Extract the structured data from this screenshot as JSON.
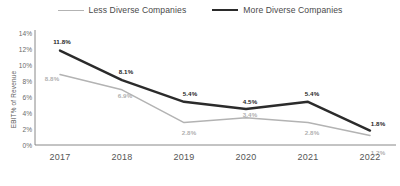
{
  "legend": {
    "entries": [
      {
        "label": "Less Diverse Companies",
        "color": "#b3b3b3",
        "key": "less"
      },
      {
        "label": "More Diverse Companies",
        "color": "#2b2b2b",
        "key": "more"
      }
    ]
  },
  "axes": {
    "ylabel": "EBIT% of Revenue",
    "yticks": [
      "14%",
      "12%",
      "10%",
      "8%",
      "6%",
      "4%",
      "2%",
      "0%"
    ],
    "xticks": [
      "2017",
      "2018",
      "2019",
      "2020",
      "2021",
      "2022"
    ]
  },
  "labels": {
    "less": [
      "8.8%",
      "6.9%",
      "2.8%",
      "3.4%",
      "2.8%",
      "1.2%"
    ],
    "more": [
      "11.8%",
      "8.1%",
      "5.4%",
      "4.5%",
      "5.4%",
      "1.8%"
    ]
  },
  "chart_data": {
    "type": "line",
    "title": "",
    "subtitle": "",
    "xlabel": "",
    "ylabel": "EBIT% of Revenue",
    "categories": [
      "2017",
      "2018",
      "2019",
      "2020",
      "2021",
      "2022"
    ],
    "series": [
      {
        "name": "Less Diverse Companies",
        "color": "#b3b3b3",
        "values": [
          8.8,
          6.9,
          2.8,
          3.4,
          2.8,
          1.2
        ]
      },
      {
        "name": "More Diverse Companies",
        "color": "#2b2b2b",
        "values": [
          11.8,
          8.1,
          5.4,
          4.5,
          5.4,
          1.8
        ]
      }
    ],
    "ylim": [
      0,
      14
    ],
    "ytick_values": [
      0,
      2,
      4,
      6,
      8,
      10,
      12,
      14
    ],
    "ytick_labels": [
      "0%",
      "2%",
      "4%",
      "6%",
      "8%",
      "10%",
      "12%",
      "14%"
    ],
    "grid": false,
    "legend_position": "top-center",
    "data_labels": true
  }
}
